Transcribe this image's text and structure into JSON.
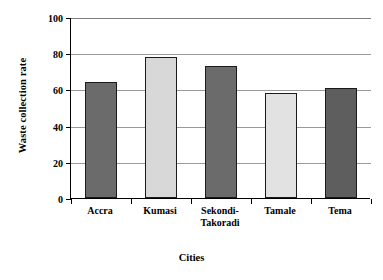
{
  "chart_data": {
    "type": "bar",
    "title": "",
    "xlabel": "Cities",
    "ylabel": "Waste collection rate",
    "categories": [
      "Accra",
      "Kumasi",
      "Sekondi-\nTakoradi",
      "Tamale",
      "Tema"
    ],
    "category_labels_flat": [
      "Accra",
      "Kumasi",
      "Sekondi-Takoradi",
      "Tamale",
      "Tema"
    ],
    "values": [
      64,
      78,
      73,
      58,
      61
    ],
    "ylim": [
      0,
      100
    ],
    "yticks": [
      0,
      20,
      40,
      60,
      80,
      100
    ],
    "ytick_labels": [
      "0",
      "20",
      "40",
      "60",
      "80",
      "100"
    ],
    "grid": true,
    "grid_axis": "y",
    "legend": false,
    "bar_colors": [
      "#6b6b6b",
      "#d8d8d8",
      "#6b6b6b",
      "#e2e2e2",
      "#5e5e5e"
    ],
    "bar_edge_color": "#1a1a1a",
    "plot_background": "#ffffff",
    "gridline_color": "#9a9a9a",
    "axis_color": "#000000"
  }
}
